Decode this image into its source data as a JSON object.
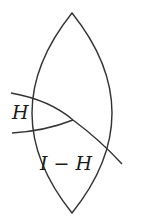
{
  "diagram": {
    "type": "lens-shaped region partitioned by curves",
    "stroke_color": "#333333",
    "background_color": "#ffffff",
    "labels": {
      "region_small": "H",
      "region_large": "I − H"
    }
  }
}
